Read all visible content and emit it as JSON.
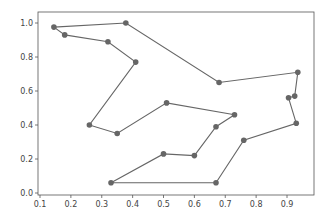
{
  "chart_data": {
    "type": "line",
    "title": "",
    "xlabel": "",
    "ylabel": "",
    "xlim": [
      0.095,
      0.98
    ],
    "ylim": [
      -0.03,
      1.05
    ],
    "grid": false,
    "legend": null,
    "x_ticks": [
      "0.1",
      "0.2",
      "0.3",
      "0.4",
      "0.5",
      "0.6",
      "0.7",
      "0.8",
      "0.9"
    ],
    "y_ticks": [
      "0.0",
      "0.2",
      "0.4",
      "0.6",
      "0.8",
      "1.0"
    ],
    "series": [
      {
        "name": "tour",
        "color": "#666666",
        "marker": "circle",
        "closed": true,
        "x": [
          0.145,
          0.18,
          0.32,
          0.41,
          0.26,
          0.35,
          0.51,
          0.73,
          0.67,
          0.6,
          0.5,
          0.33,
          0.67,
          0.76,
          0.93,
          0.905,
          0.925,
          0.935,
          0.68,
          0.378
        ],
        "y": [
          0.976,
          0.93,
          0.89,
          0.77,
          0.4,
          0.35,
          0.53,
          0.46,
          0.39,
          0.22,
          0.23,
          0.06,
          0.06,
          0.31,
          0.41,
          0.56,
          0.57,
          0.71,
          0.65,
          1.0
        ]
      }
    ]
  }
}
